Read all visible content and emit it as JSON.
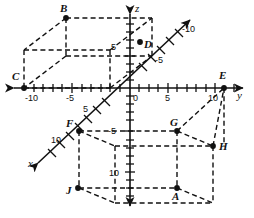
{
  "figure": {
    "type": "3d-coordinate-diagram",
    "background_color": "#ffffff",
    "ink_color": "#111111"
  },
  "axes": {
    "z": {
      "label": "z",
      "orientation": "vertical",
      "positive_direction": "up",
      "tick_labels": [
        {
          "text": "5",
          "value": 5
        },
        {
          "text": "-5",
          "value": -5
        },
        {
          "text": "10",
          "value": -10
        }
      ]
    },
    "y": {
      "label": "y",
      "orientation": "horizontal",
      "positive_direction": "right",
      "tick_labels": [
        {
          "text": "-10",
          "value": -10
        },
        {
          "text": "-5",
          "value": -5
        },
        {
          "text": "0",
          "value": 0
        },
        {
          "text": "5",
          "value": 5
        },
        {
          "text": "10",
          "value": 10
        }
      ]
    },
    "x": {
      "label": "x",
      "orientation": "diagonal",
      "positive_direction": "lower-left",
      "tick_labels": [
        {
          "text": "-10",
          "value": -10
        },
        {
          "text": "-5",
          "value": -5
        },
        {
          "text": "5",
          "value": 5
        },
        {
          "text": "10",
          "value": 10
        }
      ]
    }
  },
  "vertices": [
    {
      "label": "A",
      "x": 177,
      "y": 188
    },
    {
      "label": "B",
      "x": 66,
      "y": 18
    },
    {
      "label": "C",
      "x": 24,
      "y": 88
    },
    {
      "label": "D",
      "x": 152,
      "y": 42
    },
    {
      "label": "E",
      "x": 224,
      "y": 88
    },
    {
      "label": "F",
      "x": 79,
      "y": 131
    },
    {
      "label": "G",
      "x": 177,
      "y": 131
    },
    {
      "label": "H",
      "x": 213,
      "y": 146
    },
    {
      "label": "J",
      "x": 78,
      "y": 188
    }
  ],
  "solids": [
    {
      "name": "upper-left-prism",
      "vertices": [
        "B",
        "C",
        "D"
      ]
    },
    {
      "name": "lower-right-prism",
      "vertices": [
        "E",
        "F",
        "G",
        "H",
        "J",
        "A"
      ]
    }
  ]
}
